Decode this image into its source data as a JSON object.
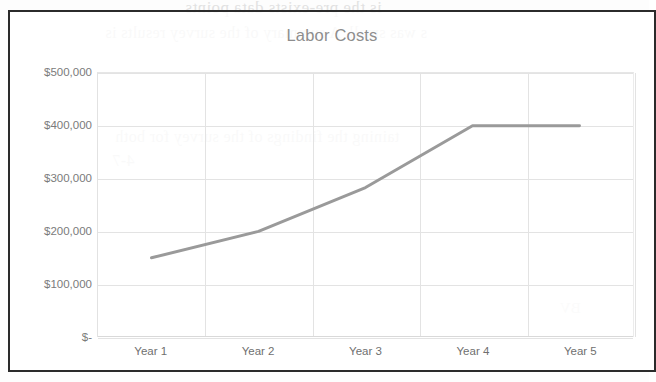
{
  "chart_data": {
    "type": "line",
    "title": "Labor Costs",
    "xlabel": "",
    "ylabel": "",
    "categories": [
      "Year 1",
      "Year 2",
      "Year 3",
      "Year 4",
      "Year 5"
    ],
    "series": [
      {
        "name": "Labor Costs",
        "values": [
          150000,
          200000,
          283000,
          400000,
          400000
        ],
        "color": "#9a9a9a"
      }
    ],
    "ylim": [
      0,
      500000
    ],
    "y_ticks": [
      0,
      100000,
      200000,
      300000,
      400000,
      500000
    ],
    "y_tick_labels": [
      "$-",
      "$100,000",
      "$200,000",
      "$300,000",
      "$400,000",
      "$500,000"
    ],
    "grid": true,
    "legend": "none",
    "markers": false
  },
  "chart": {
    "title": "Labor Costs",
    "border_color": "#2b2b2b",
    "plot_bg": "#ffffff",
    "gridline_color": "#e3e3e3",
    "tick_label_color": "#7b7b7b",
    "title_color": "#8d8d8d"
  },
  "page_bleed": {
    "line_1": "is the pre-exists data points",
    "line_2": "s was small. A summary of the survey results is",
    "line_3": "taining the findings of the survey for both",
    "line_4": "4-7",
    "line_5": "BV"
  }
}
